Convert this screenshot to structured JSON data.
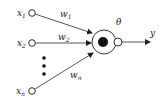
{
  "diagram": {
    "inputs": [
      {
        "label": "x",
        "subscript": "1",
        "weight_label": "w",
        "weight_subscript": "1"
      },
      {
        "label": "x",
        "subscript": "2",
        "weight_label": "w",
        "weight_subscript": "2"
      },
      {
        "label": "x",
        "subscript": "n",
        "weight_label": "w",
        "weight_subscript": "n"
      }
    ],
    "ellipsis": "⋮",
    "threshold_label": "θ",
    "output_label": "y",
    "colors": {
      "stroke": "#333333",
      "node_fill": "#ffffff",
      "core_fill": "#111111",
      "text": "#222222"
    }
  }
}
